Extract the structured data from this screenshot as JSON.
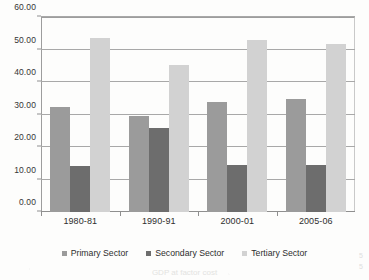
{
  "chart_data": {
    "type": "bar",
    "title": "",
    "xlabel": "",
    "ylabel": "",
    "categories": [
      "1980-81",
      "1990-91",
      "2000-01",
      "2005-06"
    ],
    "series": [
      {
        "name": "Primary Sector",
        "color": "#9b9b9b",
        "values": [
          32.4,
          29.4,
          33.9,
          34.9
        ]
      },
      {
        "name": "Secondary Sector",
        "color": "#6d6d6d",
        "values": [
          14.2,
          25.9,
          14.5,
          14.6
        ]
      },
      {
        "name": "Tertiary Sector",
        "color": "#d2d2d2",
        "values": [
          53.4,
          45.2,
          52.8,
          51.7
        ]
      }
    ],
    "ylim": [
      0,
      60
    ],
    "ytick_step": 10,
    "ytick_labels": [
      "0.00",
      "10.00",
      "20.00",
      "30.00",
      "40.00",
      "50.00",
      "60.00"
    ],
    "grid": true,
    "grid_axis": "y",
    "legend_position": "bottom"
  },
  "legend": {
    "items": [
      {
        "label": "Primary Sector"
      },
      {
        "label": "Secondary Sector"
      },
      {
        "label": "Tertiary Sector"
      }
    ]
  },
  "caption": {
    "ghost_text": "GDP at factor cost"
  },
  "edge": {
    "marks": "5\n5"
  }
}
